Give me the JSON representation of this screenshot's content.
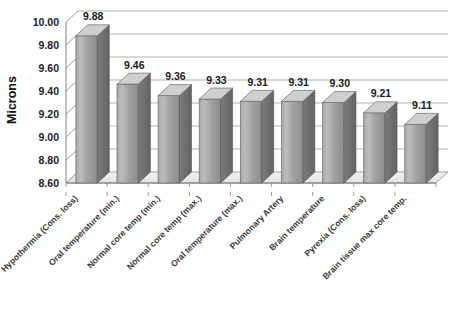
{
  "chart_data": {
    "type": "bar",
    "title": "",
    "subtitle": "",
    "xlabel": "",
    "ylabel": "Microns",
    "ylim": [
      8.6,
      10.0
    ],
    "ytick_step": 0.2,
    "grid": true,
    "legend": "none",
    "style": "3d-column",
    "categories": [
      "Hypothermia (Cons. loss)",
      "Oral temperature (min.)",
      "Normal core temp (min.)",
      "Normal core temp (max.)",
      "Oral temperature (max.)",
      "Pulmonary Artery",
      "Brain temperature",
      "Pyrexia (Cons. loss)",
      "Brain tissue max core temp."
    ],
    "values": [
      9.88,
      9.46,
      9.36,
      9.33,
      9.31,
      9.31,
      9.3,
      9.21,
      9.11
    ],
    "value_labels": [
      "9.88",
      "9.46",
      "9.36",
      "9.33",
      "9.31",
      "9.31",
      "9.30",
      "9.21",
      "9.11"
    ],
    "ytick_labels": [
      "10.00",
      "9.80",
      "9.60",
      "9.40",
      "9.20",
      "9.00",
      "8.80",
      "8.60"
    ],
    "ytick_values": [
      10.0,
      9.8,
      9.6,
      9.4,
      9.2,
      9.0,
      8.8,
      8.6
    ],
    "colors": {
      "bar_front_top": "#b4b4b4",
      "bar_front_bottom": "#8f8f8f",
      "bar_side": "#6f6f6f",
      "bar_top": "#cfcfcf",
      "gridline": "#aaaaaa",
      "axis": "#8e8e8e",
      "text": "#1a1a1a",
      "background": "#ffffff"
    }
  }
}
